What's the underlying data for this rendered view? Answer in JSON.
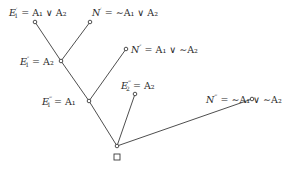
{
  "diagram": {
    "type": "tree",
    "stroke_color": "#3a3a3a",
    "nodes": [
      {
        "id": "E1p",
        "x": 35,
        "y": 22
      },
      {
        "id": "Np",
        "x": 90,
        "y": 22
      },
      {
        "id": "E1pp",
        "x": 61,
        "y": 61
      },
      {
        "id": "Npp",
        "x": 126,
        "y": 49
      },
      {
        "id": "E1ppp",
        "x": 89,
        "y": 101
      },
      {
        "id": "E2ppp",
        "x": 135,
        "y": 94
      },
      {
        "id": "Nppp",
        "x": 252,
        "y": 99
      },
      {
        "id": "root",
        "x": 117,
        "y": 146
      }
    ],
    "edges": [
      [
        "E1p",
        "E1pp"
      ],
      [
        "Np",
        "E1pp"
      ],
      [
        "E1pp",
        "E1ppp"
      ],
      [
        "Npp",
        "E1ppp"
      ],
      [
        "E1ppp",
        "root"
      ],
      [
        "E2ppp",
        "root"
      ],
      [
        "Nppp",
        "root"
      ]
    ],
    "labels": {
      "e1_prime": {
        "name": "E",
        "sub": "1",
        "sup": "′",
        "eq": "= A₁ ∨ A₂"
      },
      "n_prime": {
        "name": "N",
        "sup": "′",
        "eq": "= ∼A₁ ∨ A₂"
      },
      "e1_dprime": {
        "name": "E",
        "sub": "1",
        "sup": "″",
        "eq": "= A₂"
      },
      "n_dprime": {
        "name": "N",
        "sup": "″",
        "eq": "= A₁ ∨ ∼A₂"
      },
      "e2_tprime": {
        "name": "E",
        "sub": "2",
        "sup": "‴",
        "eq": "= A₂"
      },
      "e1_tprime": {
        "name": "E",
        "sub": "1",
        "sup": "‴",
        "eq": "= A₁"
      },
      "n_tprime": {
        "name": "N",
        "sup": "‴",
        "eq": "= ∼A₁ ∨ ∼A₂"
      }
    },
    "root_marker": "□"
  }
}
